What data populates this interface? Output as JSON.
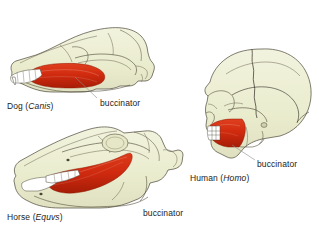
{
  "figure": {
    "background_color": "#ffffff",
    "bone_color": "#edeed2",
    "bone_shadow_color": "#dcdcbc",
    "muscle_color": "#d42c11",
    "muscle_dark_color": "#a81d07",
    "tooth_color": "#ffffff",
    "outline_color": "#4a4636",
    "suture_color": "#2e2a22",
    "leader_color": "#8d8d8d"
  },
  "specimens": [
    {
      "id": "dog",
      "common_name": "Dog",
      "genus": "Canis",
      "open_paren": " (",
      "close_paren": ")",
      "muscle_label": "buccinator"
    },
    {
      "id": "horse",
      "common_name": "Horse",
      "genus": "Equvs",
      "open_paren": " (",
      "close_paren": ")",
      "muscle_label": "buccinator"
    },
    {
      "id": "human",
      "common_name": "Human",
      "genus": "Homo",
      "open_paren": " (",
      "close_paren": ")",
      "muscle_label": "buccinator"
    }
  ]
}
